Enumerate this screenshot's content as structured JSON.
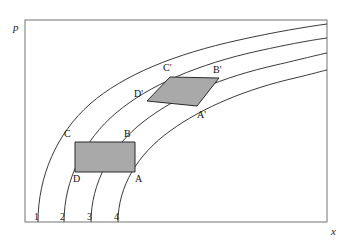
{
  "figure": {
    "kind": "characteristic-curves-diagram",
    "background_color": "#ffffff",
    "frame": {
      "stroke_color": "#8a8a8a",
      "stroke_width": 1.2,
      "x": 25,
      "y": 20,
      "width": 302,
      "height": 202
    }
  },
  "axes": {
    "y_label": "p",
    "x_label": "x",
    "y_label_pos": {
      "x": 13,
      "y": 22
    },
    "x_label_pos": {
      "x": 331,
      "y": 226
    }
  },
  "curves": {
    "stroke_color": "#3a3a3a",
    "stroke_width": 1.0,
    "labels": [
      {
        "text": "1",
        "x": 34,
        "y": 212
      },
      {
        "text": "2",
        "x": 60,
        "y": 212
      },
      {
        "text": "3",
        "x": 87,
        "y": 212
      },
      {
        "text": "4",
        "x": 114,
        "y": 212
      }
    ],
    "paths": [
      {
        "name": "curve-1",
        "d": "M 38 222 C 38 176 57 133 90 104 C 123 75 175 54 239 40 C 275 32 305 27 327 24"
      },
      {
        "name": "curve-2",
        "d": "M 64 222 C 64 180 84 140 116 113 C 149 85 199 64 258 51 C 290 44 312 40 327 38"
      },
      {
        "name": "curve-3",
        "d": "M 91 222 C 91 183 111 147 143 122 C 176 96 223 77 276 65 C 302 59 317 55 327 53"
      },
      {
        "name": "curve-4",
        "d": "M 118 222 C 118 186 138 154 170 131 C 203 107 247 89 295 78 C 312 74 322 71 327 70"
      }
    ]
  },
  "regions": [
    {
      "name": "region-abcd",
      "fill_color": "#a9a9a9",
      "stroke_color": "#2a2a2a",
      "stroke_width": 1.0,
      "points": "75,142 135,142 135,172 75,172",
      "vertices": [
        {
          "label": "C",
          "x": 64,
          "y": 129
        },
        {
          "label": "B",
          "x": 124,
          "y": 129
        },
        {
          "label": "A",
          "x": 135,
          "y": 174
        },
        {
          "label": "D",
          "x": 73,
          "y": 174
        }
      ]
    },
    {
      "name": "region-abcd-prime",
      "fill_color": "#a9a9a9",
      "stroke_color": "#2a2a2a",
      "stroke_width": 1.0,
      "points": "170,77 219,78 197,106 147,101",
      "vertices": [
        {
          "label": "C'",
          "x": 163,
          "y": 63
        },
        {
          "label": "B'",
          "x": 213,
          "y": 65
        },
        {
          "label": "A'",
          "x": 197,
          "y": 110
        },
        {
          "label": "D'",
          "x": 134,
          "y": 89
        }
      ]
    }
  ]
}
